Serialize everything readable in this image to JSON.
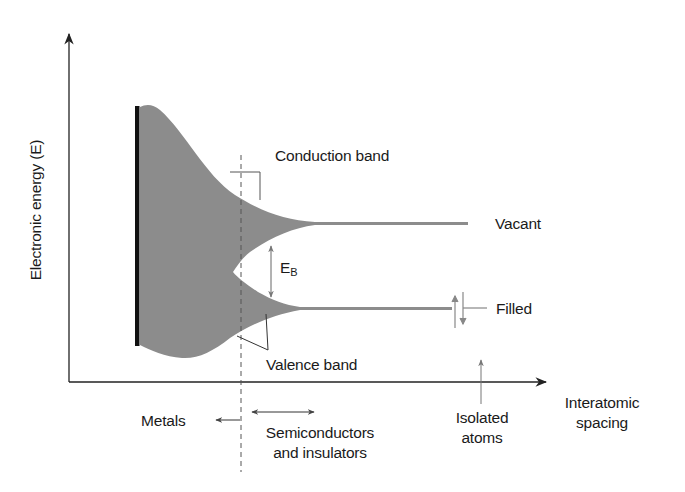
{
  "diagram": {
    "axes": {
      "y_label": "Electronic energy (E)",
      "x_label_line1": "Interatomic",
      "x_label_line2": "spacing"
    },
    "bands": {
      "conduction": "Conduction band",
      "valence": "Valence band",
      "gap_symbol": "E",
      "gap_subscript": "B"
    },
    "levels": {
      "upper": "Vacant",
      "lower": "Filled"
    },
    "regions": {
      "metals": "Metals",
      "semiconductors_line1": "Semiconductors",
      "semiconductors_line2": "and insulators",
      "isolated_line1": "Isolated",
      "isolated_line2": "atoms"
    },
    "colors": {
      "band_fill": "#8c8c8c",
      "axis": "#222222",
      "black_bar": "#111111",
      "pointer": "#555555"
    }
  }
}
